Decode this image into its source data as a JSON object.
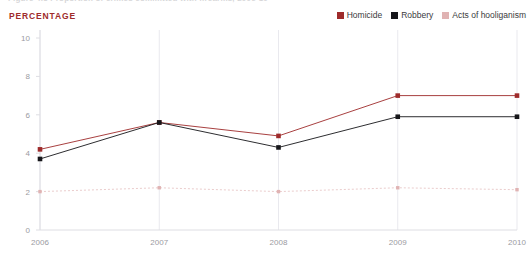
{
  "figure": {
    "title": "Figure 4.3  Proportion of crimes committed with firearms, 2006-10",
    "unit_label": "PERCENTAGE"
  },
  "legend": {
    "position": "top-right",
    "entries": [
      {
        "label": "Homicide",
        "color": "#9e2b2b"
      },
      {
        "label": "Robbery",
        "color": "#16161a"
      },
      {
        "label": "Acts of hooliganism",
        "color": "#e0b3b3"
      }
    ]
  },
  "chart_data": {
    "type": "line",
    "title": "Figure 4.3  Proportion of crimes committed with firearms, 2006-10",
    "xlabel": "",
    "ylabel": "PERCENTAGE",
    "categories": [
      "2006",
      "2007",
      "2008",
      "2009",
      "2010"
    ],
    "x": [
      2006,
      2007,
      2008,
      2009,
      2010
    ],
    "ylim": [
      0,
      10
    ],
    "yticks": [
      0,
      2,
      4,
      6,
      8,
      10
    ],
    "ytick_labels": [
      "0",
      "2",
      "4",
      "6",
      "8",
      "10"
    ],
    "grid": "vertical",
    "legend_position": "top-right",
    "series": [
      {
        "name": "Homicide",
        "color": "#9e2b2b",
        "values": [
          4.2,
          5.6,
          4.9,
          7.0,
          7.0
        ]
      },
      {
        "name": "Robbery",
        "color": "#16161a",
        "values": [
          3.7,
          5.6,
          4.3,
          5.9,
          5.9
        ]
      },
      {
        "name": "Acts of hooliganism",
        "color": "#e0b3b3",
        "values": [
          2.0,
          2.2,
          2.0,
          2.2,
          2.1
        ]
      }
    ]
  }
}
